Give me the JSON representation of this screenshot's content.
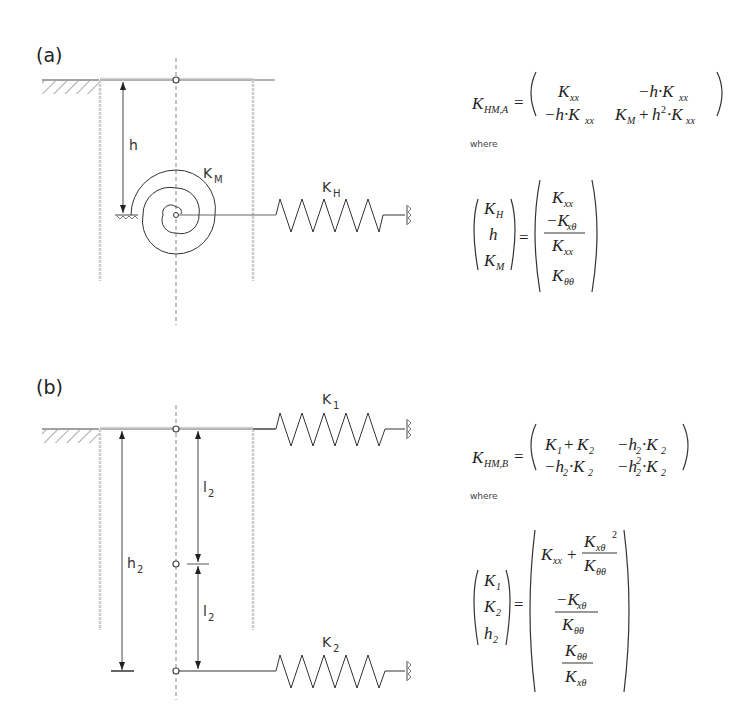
{
  "panels": {
    "a": {
      "label": "(a)",
      "dim_h": "h",
      "spring_rot": {
        "main": "K",
        "sub": "M"
      },
      "spring_lat": {
        "main": "K",
        "sub": "H"
      },
      "equation_main": {
        "lhs": {
          "main": "K",
          "sub": "HM,A"
        },
        "matrix": [
          [
            "K_xx",
            "-h·K_xx"
          ],
          [
            "-h·K_xx",
            "K_M + h²·K_xx"
          ]
        ]
      },
      "where_label": "where",
      "equation_def": {
        "lhs": [
          "K_H",
          "h",
          "K_M"
        ],
        "rhs": [
          "K_xx",
          "-K_xθ / K_xx",
          "K_θθ"
        ]
      }
    },
    "b": {
      "label": "(b)",
      "dim_h2": {
        "main": "h",
        "sub": "2"
      },
      "dim_l2_upper": {
        "main": "l",
        "sub": "2"
      },
      "dim_l2_lower": {
        "main": "l",
        "sub": "2"
      },
      "spring_top": {
        "main": "K",
        "sub": "1"
      },
      "spring_bottom": {
        "main": "K",
        "sub": "2"
      },
      "equation_main": {
        "lhs": {
          "main": "K",
          "sub": "HM,B"
        },
        "matrix": [
          [
            "K_1 + K_2",
            "-h_2·K_2"
          ],
          [
            "-h_2·K_2",
            "-h_2²·K_2"
          ]
        ]
      },
      "where_label": "where",
      "equation_def": {
        "lhs": [
          "K_1",
          "K_2",
          "h_2"
        ],
        "rhs": [
          "K_xx + K_xθ² / K_θθ",
          "-K_xθ / K_θθ",
          "K_θθ / K_xθ"
        ]
      }
    }
  }
}
